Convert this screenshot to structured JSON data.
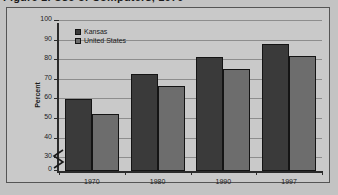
{
  "figure": {
    "title_clipped": "Figure 1.  Use of Computers, 1970",
    "background_color": "#c3c3c3",
    "frame_color": "#555555"
  },
  "chart_data": {
    "type": "bar",
    "title": "",
    "xlabel": "",
    "ylabel": "Percent",
    "categories": [
      "1970",
      "1980",
      "1990",
      "1997"
    ],
    "series": [
      {
        "name": "Kansas",
        "color": "#3a3a3a",
        "values": [
          60,
          73,
          81.5,
          88.5
        ]
      },
      {
        "name": "United States",
        "color": "#6d6d6d",
        "values": [
          52.5,
          67,
          75.5,
          82
        ]
      }
    ],
    "ylim": [
      0,
      100
    ],
    "yticks": [
      0,
      30,
      40,
      50,
      60,
      70,
      80,
      90,
      100
    ],
    "ytick_labels": [
      "0",
      "30",
      "40",
      "50",
      "60",
      "70",
      "80",
      "90",
      "100"
    ],
    "axis_break": true,
    "axis_break_between": [
      0,
      30
    ],
    "grid": true,
    "grid_axis": "y",
    "legend_position": "top-left-inside"
  },
  "legend": {
    "items": [
      {
        "label": "Kansas"
      },
      {
        "label": "United States"
      }
    ]
  }
}
